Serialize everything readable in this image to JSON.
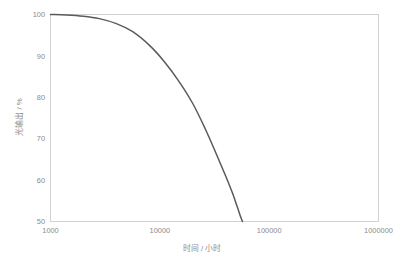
{
  "chart_data": {
    "type": "line",
    "title": "",
    "subtitle": "",
    "xlabel": "时间 / 小时",
    "ylabel": "光输出 / %",
    "xscale": "log",
    "yscale": "linear",
    "xlim": [
      1000,
      1000000
    ],
    "ylim": [
      50,
      100
    ],
    "grid": false,
    "legend": false,
    "legend_position": "none",
    "xticks": [
      1000,
      10000,
      100000,
      1000000
    ],
    "xtick_labels": [
      "1000",
      "10000",
      "100000",
      "1000000"
    ],
    "yticks": [
      50,
      60,
      70,
      80,
      90,
      100
    ],
    "ytick_labels": [
      "50",
      "60",
      "70",
      "80",
      "90",
      "100"
    ],
    "series": [
      {
        "name": "光输出衰减",
        "color": "#5a5a5a",
        "x": [
          1000,
          1400,
          2000,
          2800,
          4000,
          5600,
          8000,
          11000,
          15000,
          20000,
          26000,
          33000,
          40000,
          46000,
          51000,
          55000,
          57000
        ],
        "values": [
          100.0,
          99.9,
          99.6,
          99.0,
          97.8,
          95.9,
          92.6,
          88.6,
          83.8,
          78.5,
          72.4,
          66.2,
          61.0,
          57.0,
          53.6,
          51.0,
          50.0
        ]
      }
    ],
    "annotations": []
  },
  "axis": {
    "x_title": "时间 / 小时",
    "y_title": "光输出 / %"
  },
  "colors": {
    "curve": "#5a5a5a",
    "frame": "#d2d2d2",
    "tick_text": "#8a8a8a",
    "background": "#ffffff"
  }
}
